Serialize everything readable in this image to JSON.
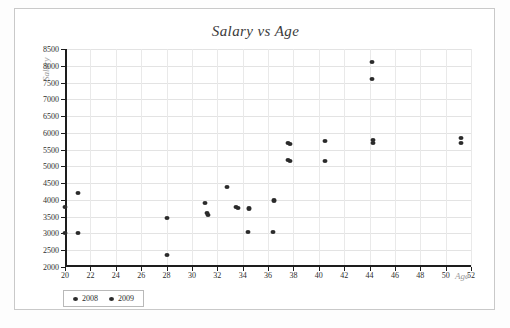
{
  "chart_data": {
    "type": "scatter",
    "title": "Salary vs Age",
    "xlabel": "Age",
    "ylabel": "Salary",
    "xlim": [
      20,
      52
    ],
    "ylim": [
      2000,
      8500
    ],
    "xticks": [
      20,
      22,
      24,
      26,
      28,
      30,
      32,
      34,
      36,
      38,
      40,
      42,
      44,
      46,
      48,
      50,
      52
    ],
    "yticks": [
      2000,
      2500,
      3000,
      3500,
      4000,
      4500,
      5000,
      5500,
      6000,
      6500,
      7000,
      7500,
      8000,
      8500
    ],
    "grid": true,
    "legend_position": "bottom-left",
    "series": [
      {
        "name": "2008",
        "color": "#2b2b2b",
        "points": [
          {
            "x": 20.0,
            "y": 3800
          },
          {
            "x": 20.0,
            "y": 3000
          },
          {
            "x": 21.0,
            "y": 4200
          },
          {
            "x": 28.0,
            "y": 3450
          },
          {
            "x": 28.0,
            "y": 2350
          },
          {
            "x": 31.0,
            "y": 3900
          },
          {
            "x": 31.2,
            "y": 3600
          },
          {
            "x": 32.8,
            "y": 4400
          },
          {
            "x": 33.5,
            "y": 3800
          },
          {
            "x": 34.5,
            "y": 3750
          },
          {
            "x": 34.4,
            "y": 3050
          },
          {
            "x": 36.5,
            "y": 4000
          },
          {
            "x": 36.4,
            "y": 3050
          },
          {
            "x": 37.6,
            "y": 5700
          },
          {
            "x": 37.6,
            "y": 5200
          },
          {
            "x": 40.5,
            "y": 5750
          },
          {
            "x": 44.2,
            "y": 8100
          },
          {
            "x": 44.2,
            "y": 7600
          },
          {
            "x": 44.3,
            "y": 5800
          },
          {
            "x": 51.2,
            "y": 5850
          }
        ]
      },
      {
        "name": "2009",
        "color": "#2b2b2b",
        "points": [
          {
            "x": 21.0,
            "y": 3000
          },
          {
            "x": 31.3,
            "y": 3560
          },
          {
            "x": 33.6,
            "y": 3760
          },
          {
            "x": 34.5,
            "y": 3720
          },
          {
            "x": 36.5,
            "y": 3960
          },
          {
            "x": 37.7,
            "y": 5660
          },
          {
            "x": 37.7,
            "y": 5160
          },
          {
            "x": 40.5,
            "y": 5150
          },
          {
            "x": 44.3,
            "y": 5700
          },
          {
            "x": 51.2,
            "y": 5700
          }
        ]
      }
    ]
  },
  "legend": {
    "entries": [
      {
        "label": "2008",
        "color": "#2b2b2b"
      },
      {
        "label": "2009",
        "color": "#2b2b2b"
      }
    ]
  }
}
